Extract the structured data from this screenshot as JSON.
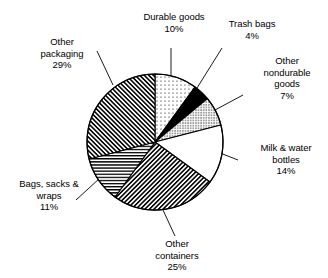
{
  "chart_data": {
    "type": "pie",
    "title": "",
    "subtitle": "",
    "xlabel": "",
    "ylabel": "",
    "legend_position": "callout-labels",
    "grid": false,
    "units": "percent",
    "total": 100,
    "categories": [
      "Durable goods",
      "Trash bags",
      "Other nondurable goods",
      "Milk & water bottles",
      "Other containers",
      "Bags, sacks & wraps",
      "Other packaging"
    ],
    "values": [
      10,
      4,
      7,
      14,
      25,
      11,
      29
    ],
    "slices": [
      {
        "name": "Durable goods",
        "label_lines": [
          "Durable goods"
        ],
        "value": 10,
        "percent_text": "10%",
        "pattern": "sparse-dots",
        "fill_color": "#ffffff",
        "ink_color": "#000000",
        "start_angle_deg": 0,
        "end_angle_deg": 36
      },
      {
        "name": "Trash bags",
        "label_lines": [
          "Trash bags"
        ],
        "value": 4,
        "percent_text": "4%",
        "pattern": "solid",
        "fill_color": "#000000",
        "ink_color": "#000000",
        "start_angle_deg": 36,
        "end_angle_deg": 50.4
      },
      {
        "name": "Other nondurable goods",
        "label_lines": [
          "Other",
          "nondurable",
          "goods"
        ],
        "value": 7,
        "percent_text": "7%",
        "pattern": "dense-dots",
        "fill_color": "#ffffff",
        "ink_color": "#000000",
        "start_angle_deg": 50.4,
        "end_angle_deg": 75.6
      },
      {
        "name": "Milk & water bottles",
        "label_lines": [
          "Milk & water",
          "bottles"
        ],
        "value": 14,
        "percent_text": "14%",
        "pattern": "none",
        "fill_color": "#ffffff",
        "ink_color": "#000000",
        "start_angle_deg": 75.6,
        "end_angle_deg": 126
      },
      {
        "name": "Other containers",
        "label_lines": [
          "Other",
          "containers"
        ],
        "value": 25,
        "percent_text": "25%",
        "pattern": "diagonal-forward-hatch",
        "fill_color": "#ffffff",
        "ink_color": "#000000",
        "start_angle_deg": 126,
        "end_angle_deg": 216
      },
      {
        "name": "Bags, sacks & wraps",
        "label_lines": [
          "Bags, sacks &",
          "wraps"
        ],
        "value": 11,
        "percent_text": "11%",
        "pattern": "horizontal-lines",
        "fill_color": "#ffffff",
        "ink_color": "#000000",
        "start_angle_deg": 216,
        "end_angle_deg": 255.6
      },
      {
        "name": "Other packaging",
        "label_lines": [
          "Other",
          "packaging"
        ],
        "value": 29,
        "percent_text": "29%",
        "pattern": "diagonal-back-hatch",
        "fill_color": "#ffffff",
        "ink_color": "#000000",
        "start_angle_deg": 255.6,
        "end_angle_deg": 360
      }
    ]
  },
  "labels": {
    "durable_goods": {
      "line1": "Durable goods",
      "pct": "10%"
    },
    "trash_bags": {
      "line1": "Trash bags",
      "pct": "4%"
    },
    "other_nondurable": {
      "line1": "Other",
      "line2": "nondurable",
      "line3": "goods",
      "pct": "7%"
    },
    "milk_water_bottles": {
      "line1": "Milk & water",
      "line2": "bottles",
      "pct": "14%"
    },
    "other_containers": {
      "line1": "Other",
      "line2": "containers",
      "pct": "25%"
    },
    "bags_sacks_wraps": {
      "line1": "Bags, sacks &",
      "line2": "wraps",
      "pct": "11%"
    },
    "other_packaging": {
      "line1": "Other",
      "line2": "packaging",
      "pct": "29%"
    }
  },
  "style": {
    "outline_color": "#000000",
    "leader_color": "#000000",
    "background": "#ffffff"
  }
}
